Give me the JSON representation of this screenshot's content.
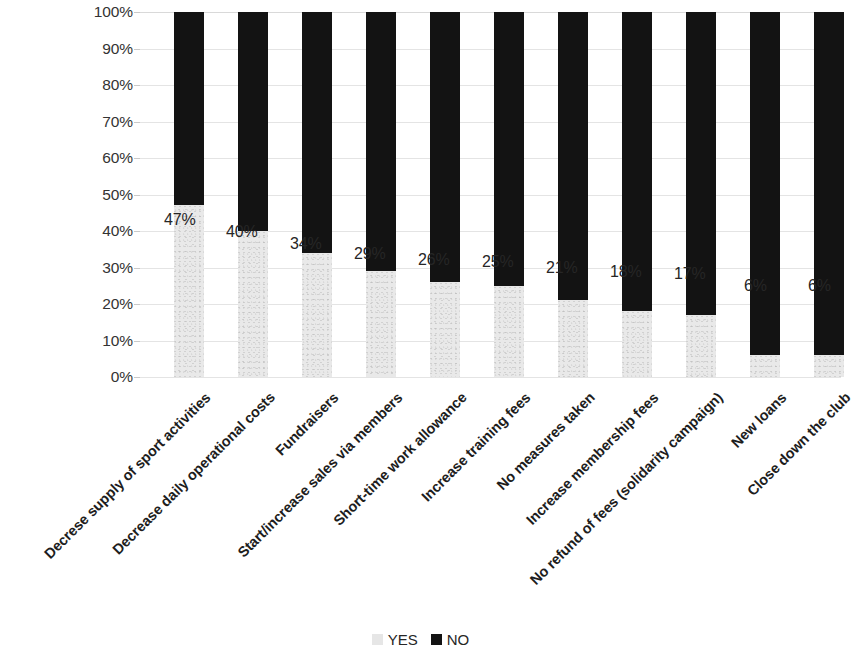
{
  "chart_data": {
    "type": "bar",
    "title": "",
    "subtitle": "",
    "xlabel": "",
    "ylabel": "",
    "stacked": true,
    "stack_total": 100,
    "ylim": [
      0,
      100
    ],
    "grid": true,
    "legend_position": "bottom",
    "y_tick_labels": [
      "100%",
      "90%",
      "80%",
      "70%",
      "60%",
      "50%",
      "40%",
      "30%",
      "20%",
      "10%",
      "0%"
    ],
    "y_ticks": [
      100,
      90,
      80,
      70,
      60,
      50,
      40,
      30,
      20,
      10,
      0
    ],
    "categories": [
      "Decrese supply of sport activities",
      "Decrease daily operational costs",
      "Fundraisers",
      "Start/increase sales via members",
      "Short-time work allowance",
      "Increase training fees",
      "No measures taken",
      "Increase membership fees",
      "No refund of fees (solidarity campaign)",
      "New loans",
      "Close down the club"
    ],
    "series": [
      {
        "name": "YES",
        "color": "#e9e9e9",
        "values": [
          47,
          40,
          34,
          29,
          26,
          25,
          21,
          18,
          17,
          6,
          6
        ],
        "labels": [
          "47%",
          "40%",
          "34%",
          "29%",
          "26%",
          "25%",
          "21%",
          "18%",
          "17%",
          "6%",
          "6%"
        ]
      },
      {
        "name": "NO",
        "color": "#131313",
        "values": [
          53,
          60,
          66,
          71,
          74,
          75,
          79,
          82,
          83,
          94,
          94
        ],
        "labels": [
          "",
          "",
          "",
          "",
          "",
          "",
          "",
          "",
          "",
          "",
          ""
        ]
      }
    ],
    "legend": [
      {
        "label": "YES",
        "color": "#e9e9e9"
      },
      {
        "label": "NO",
        "color": "#131313"
      }
    ]
  }
}
